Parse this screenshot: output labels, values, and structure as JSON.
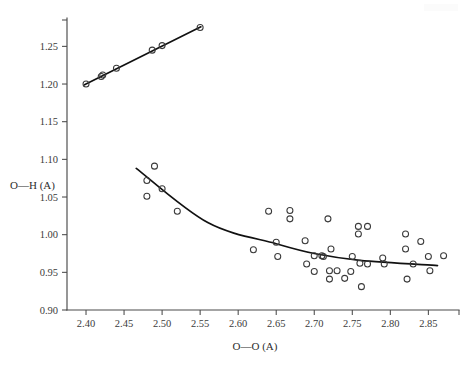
{
  "figure": {
    "background_color": "#ffffff",
    "ink_color": "#111111",
    "axis_color": "#4a4a4a"
  },
  "chart_data": {
    "type": "scatter",
    "title": "",
    "subtitle": "",
    "xlabel": "O—O (A)",
    "ylabel": "O—H (A)",
    "xlim": [
      2.375,
      2.885
    ],
    "ylim": [
      0.9,
      1.285
    ],
    "xticks": [
      2.4,
      2.45,
      2.5,
      2.55,
      2.6,
      2.65,
      2.7,
      2.75,
      2.8,
      2.85
    ],
    "xticklabels": [
      "2.40",
      "2.45",
      "2.50",
      "2.55",
      "2.60",
      "2.65",
      "2.70",
      "2.75",
      "2.80",
      "2.85"
    ],
    "yticks": [
      0.9,
      0.95,
      1.0,
      1.05,
      1.1,
      1.15,
      1.2,
      1.25
    ],
    "yticklabels": [
      "0.90",
      "0.95",
      "1.00",
      "1.05",
      "1.10",
      "1.15",
      "1.20",
      "1.25"
    ],
    "grid": false,
    "legend": null,
    "legend_position": "none",
    "marker_style": "open-circle",
    "series": [
      {
        "name": "upper-branch",
        "description": "Long O—H distance branch, increasing linearly with O—O distance",
        "marker": "open-circle",
        "points": [
          {
            "x": 2.4,
            "y": 1.2
          },
          {
            "x": 2.42,
            "y": 1.21
          },
          {
            "x": 2.422,
            "y": 1.212
          },
          {
            "x": 2.44,
            "y": 1.221
          },
          {
            "x": 2.487,
            "y": 1.245
          },
          {
            "x": 2.5,
            "y": 1.251
          },
          {
            "x": 2.55,
            "y": 1.275
          }
        ],
        "fit": {
          "type": "line",
          "x_start": 2.398,
          "y_start": 1.199,
          "x_end": 2.551,
          "y_end": 1.276
        }
      },
      {
        "name": "lower-branch",
        "description": "Short O—H distance branch, decreasing and levelling off with O—O distance",
        "marker": "open-circle",
        "points": [
          {
            "x": 2.48,
            "y": 1.072
          },
          {
            "x": 2.48,
            "y": 1.051
          },
          {
            "x": 2.49,
            "y": 1.091
          },
          {
            "x": 2.5,
            "y": 1.061
          },
          {
            "x": 2.52,
            "y": 1.031
          },
          {
            "x": 2.62,
            "y": 0.98
          },
          {
            "x": 2.64,
            "y": 1.031
          },
          {
            "x": 2.65,
            "y": 0.99
          },
          {
            "x": 2.652,
            "y": 0.971
          },
          {
            "x": 2.668,
            "y": 1.032
          },
          {
            "x": 2.668,
            "y": 1.021
          },
          {
            "x": 2.688,
            "y": 0.992
          },
          {
            "x": 2.69,
            "y": 0.961
          },
          {
            "x": 2.7,
            "y": 0.972
          },
          {
            "x": 2.7,
            "y": 0.951
          },
          {
            "x": 2.71,
            "y": 0.972
          },
          {
            "x": 2.712,
            "y": 0.971
          },
          {
            "x": 2.718,
            "y": 1.021
          },
          {
            "x": 2.72,
            "y": 0.952
          },
          {
            "x": 2.72,
            "y": 0.941
          },
          {
            "x": 2.722,
            "y": 0.981
          },
          {
            "x": 2.73,
            "y": 0.952
          },
          {
            "x": 2.74,
            "y": 0.942
          },
          {
            "x": 2.748,
            "y": 0.951
          },
          {
            "x": 2.75,
            "y": 0.971
          },
          {
            "x": 2.758,
            "y": 1.011
          },
          {
            "x": 2.758,
            "y": 1.001
          },
          {
            "x": 2.76,
            "y": 0.962
          },
          {
            "x": 2.762,
            "y": 0.931
          },
          {
            "x": 2.77,
            "y": 1.011
          },
          {
            "x": 2.77,
            "y": 0.961
          },
          {
            "x": 2.79,
            "y": 0.969
          },
          {
            "x": 2.792,
            "y": 0.961
          },
          {
            "x": 2.82,
            "y": 1.001
          },
          {
            "x": 2.82,
            "y": 0.981
          },
          {
            "x": 2.822,
            "y": 0.941
          },
          {
            "x": 2.83,
            "y": 0.961
          },
          {
            "x": 2.84,
            "y": 0.991
          },
          {
            "x": 2.85,
            "y": 0.971
          },
          {
            "x": 2.852,
            "y": 0.952
          },
          {
            "x": 2.87,
            "y": 0.972
          }
        ],
        "fit": {
          "type": "curve",
          "x_start": 2.466,
          "y_start": 1.088,
          "x_end": 2.862,
          "y_end": 0.959,
          "control_points": [
            {
              "x": 2.466,
              "y": 1.088
            },
            {
              "x": 2.56,
              "y": 1.016
            },
            {
              "x": 2.65,
              "y": 0.988
            },
            {
              "x": 2.7,
              "y": 0.975
            },
            {
              "x": 2.76,
              "y": 0.966
            },
            {
              "x": 2.862,
              "y": 0.959
            }
          ]
        }
      }
    ]
  }
}
